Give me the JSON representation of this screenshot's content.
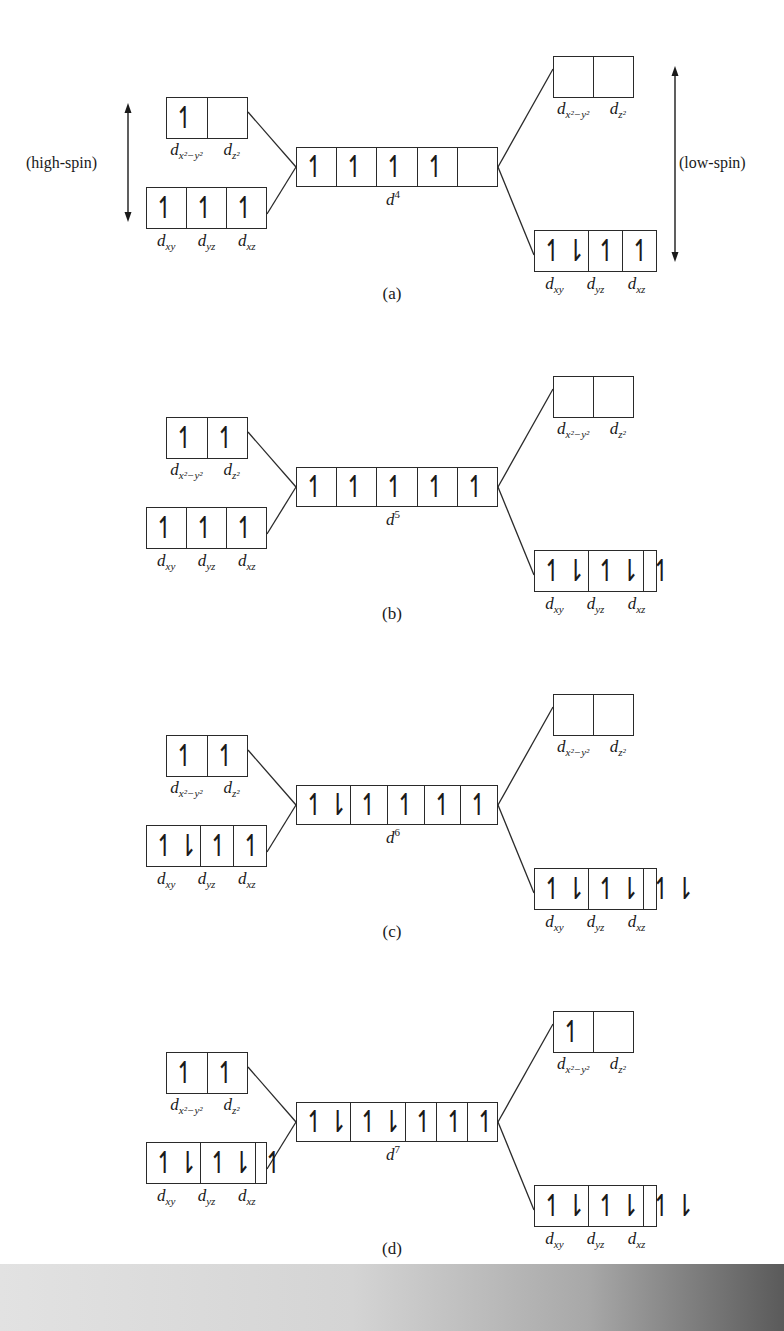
{
  "figure": {
    "high_spin_label": "(high-spin)",
    "low_spin_label": "(low-spin)",
    "eg_labels": {
      "a": "d",
      "a_sub": "x²−y²",
      "b": "d",
      "b_sub": "z²"
    },
    "t2g_labels": [
      "xy",
      "yz",
      "xz"
    ],
    "panels": [
      {
        "caption": "(a)",
        "config": "d",
        "config_sup": "4",
        "center": [
          "↿",
          "↿",
          "↿",
          "↿",
          ""
        ],
        "high_spin": {
          "eg": [
            "↿",
            ""
          ],
          "t2g": [
            "↿",
            "↿",
            "↿"
          ]
        },
        "low_spin": {
          "eg": [
            "",
            ""
          ],
          "t2g": [
            "↿⇂",
            "↿",
            "↿"
          ]
        }
      },
      {
        "caption": "(b)",
        "config": "d",
        "config_sup": "5",
        "center": [
          "↿",
          "↿",
          "↿",
          "↿",
          "↿"
        ],
        "high_spin": {
          "eg": [
            "↿",
            "↿"
          ],
          "t2g": [
            "↿",
            "↿",
            "↿"
          ]
        },
        "low_spin": {
          "eg": [
            "",
            ""
          ],
          "t2g": [
            "↿⇂",
            "↿⇂",
            "↿"
          ]
        }
      },
      {
        "caption": "(c)",
        "config": "d",
        "config_sup": "6",
        "center": [
          "↿⇂",
          "↿",
          "↿",
          "↿",
          "↿"
        ],
        "high_spin": {
          "eg": [
            "↿",
            "↿"
          ],
          "t2g": [
            "↿⇂",
            "↿",
            "↿"
          ]
        },
        "low_spin": {
          "eg": [
            "",
            ""
          ],
          "t2g": [
            "↿⇂",
            "↿⇂",
            "↿⇂"
          ]
        }
      },
      {
        "caption": "(d)",
        "config": "d",
        "config_sup": "7",
        "center": [
          "↿⇂",
          "↿⇂",
          "↿",
          "↿",
          "↿"
        ],
        "high_spin": {
          "eg": [
            "↿",
            "↿"
          ],
          "t2g": [
            "↿⇂",
            "↿⇂",
            "↿"
          ]
        },
        "low_spin": {
          "eg": [
            "↿",
            ""
          ],
          "t2g": [
            "↿⇂",
            "↿⇂",
            "↿⇂"
          ]
        }
      }
    ]
  }
}
